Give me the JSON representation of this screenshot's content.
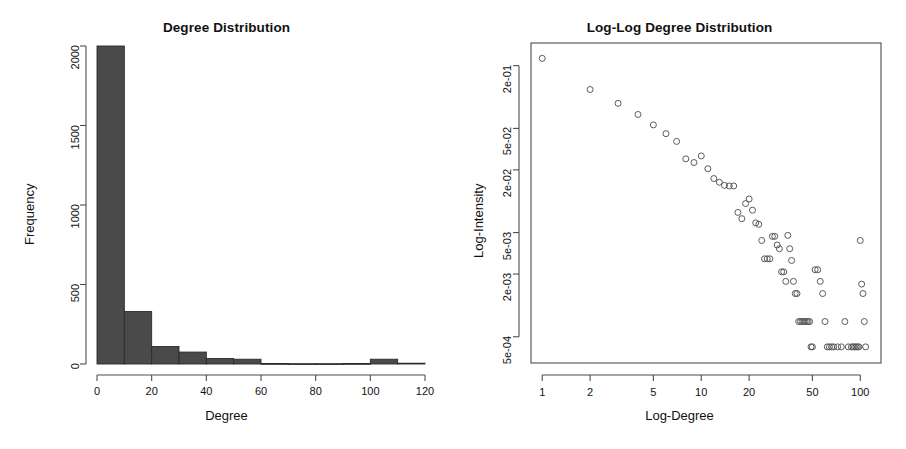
{
  "figure": {
    "background": "#ffffff",
    "panels": 2,
    "bar_color": "#4a4a4a",
    "axis_color": "#4d4d4d",
    "point_color": "#5a5a5a"
  },
  "left_panel": {
    "title": "Degree Distribution",
    "xlabel": "Degree",
    "ylabel": "Frequency",
    "xticks": [
      "0",
      "20",
      "40",
      "60",
      "80",
      "100",
      "120"
    ],
    "yticks": [
      "0",
      "500",
      "1000",
      "1500",
      "2000"
    ]
  },
  "right_panel": {
    "title": "Log-Log Degree Distribution",
    "xlabel": "Log-Degree",
    "ylabel": "Log-Intensity",
    "xticks": [
      "1",
      "2",
      "5",
      "10",
      "20",
      "50",
      "100"
    ],
    "yticks": [
      "5e-04",
      "2e-03",
      "5e-03",
      "2e-02",
      "5e-02",
      "2e-01"
    ]
  },
  "chart_data": [
    {
      "type": "bar",
      "title": "Degree Distribution",
      "xlabel": "Degree",
      "ylabel": "Frequency",
      "xlim": [
        0,
        120
      ],
      "ylim": [
        0,
        2000
      ],
      "xticks": [
        0,
        20,
        40,
        60,
        80,
        100,
        120
      ],
      "yticks": [
        0,
        500,
        1000,
        1500,
        2000
      ],
      "grid": false,
      "legend": "none",
      "bin_width": 10,
      "bin_edges": [
        0,
        10,
        20,
        30,
        40,
        50,
        60,
        70,
        80,
        90,
        100,
        110,
        120
      ],
      "categories": [
        "0-10",
        "10-20",
        "20-30",
        "30-40",
        "40-50",
        "50-60",
        "60-70",
        "70-80",
        "80-90",
        "90-100",
        "100-110",
        "110-120"
      ],
      "values": [
        2000,
        330,
        110,
        75,
        35,
        30,
        3,
        2,
        2,
        3,
        30,
        5
      ]
    },
    {
      "type": "scatter",
      "title": "Log-Log Degree Distribution",
      "xlabel": "Log-Degree",
      "ylabel": "Log-Intensity",
      "xscale": "log",
      "yscale": "log",
      "xlim": [
        0.85,
        135
      ],
      "ylim": [
        0.00028,
        0.33
      ],
      "xticks": [
        1,
        2,
        5,
        10,
        20,
        50,
        100
      ],
      "xticklabels": [
        "1",
        "2",
        "5",
        "10",
        "20",
        "50",
        "100"
      ],
      "yticks": [
        0.0005,
        0.002,
        0.005,
        0.02,
        0.05,
        0.2
      ],
      "yticklabels": [
        "5e-04",
        "2e-03",
        "5e-03",
        "2e-02",
        "5e-02",
        "2e-01"
      ],
      "grid": false,
      "legend": "none",
      "marker": "open-circle",
      "x": [
        1,
        2,
        3,
        4,
        5,
        6,
        7,
        8,
        9,
        10,
        11,
        12,
        13,
        14,
        15,
        16,
        17,
        18,
        19,
        20,
        21,
        22,
        23,
        24,
        25,
        26,
        27,
        28,
        29,
        30,
        31,
        32,
        33,
        34,
        35,
        36,
        37,
        38,
        39,
        40,
        41,
        42,
        43,
        44,
        45,
        46,
        47,
        48,
        49,
        50,
        52,
        54,
        56,
        58,
        60,
        62,
        64,
        66,
        68,
        72,
        76,
        80,
        84,
        88,
        90,
        92,
        94,
        96,
        98,
        100,
        102,
        104,
        106,
        108
      ],
      "y": [
        0.235,
        0.118,
        0.087,
        0.068,
        0.054,
        0.0445,
        0.0375,
        0.0255,
        0.0235,
        0.0272,
        0.0205,
        0.0165,
        0.0152,
        0.0142,
        0.014,
        0.014,
        0.0078,
        0.0068,
        0.0095,
        0.0105,
        0.0082,
        0.0062,
        0.006,
        0.0042,
        0.0028,
        0.0028,
        0.0028,
        0.0046,
        0.0046,
        0.0038,
        0.0035,
        0.0021,
        0.0021,
        0.0017,
        0.0047,
        0.0035,
        0.0027,
        0.0017,
        0.0013,
        0.0013,
        0.0007,
        0.0007,
        0.0007,
        0.0007,
        0.0007,
        0.0007,
        0.0007,
        0.0007,
        0.0004,
        0.0004,
        0.0022,
        0.0022,
        0.0017,
        0.0013,
        0.0007,
        0.0004,
        0.0004,
        0.0004,
        0.0004,
        0.0004,
        0.0004,
        0.0007,
        0.0004,
        0.0004,
        0.0004,
        0.0004,
        0.0004,
        0.0004,
        0.0004,
        0.0042,
        0.0016,
        0.0013,
        0.0007,
        0.0004
      ]
    }
  ]
}
